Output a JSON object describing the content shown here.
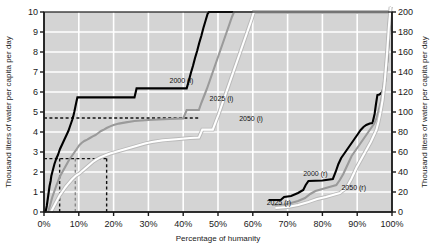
{
  "chart_data": {
    "type": "line",
    "title": "",
    "xlabel": "Percentage of humanity",
    "ylabel_left": "Thousand liters of water per capita per day",
    "ylabel_right": "Thousand liters of water per capita per day",
    "xlim": [
      0,
      100
    ],
    "ylim_left": [
      0,
      10
    ],
    "ylim_right": [
      0,
      200
    ],
    "grid": true,
    "legend_position": "inline-annotations",
    "xticks": [
      "0%",
      "10%",
      "20%",
      "30%",
      "40%",
      "50%",
      "60%",
      "70%",
      "80%",
      "90%",
      "100%"
    ],
    "xtick_values": [
      0,
      10,
      20,
      30,
      40,
      50,
      60,
      70,
      80,
      90,
      100
    ],
    "yticks_left": [
      "0",
      "1",
      "2",
      "3",
      "4",
      "5",
      "6",
      "7",
      "8",
      "9",
      "10"
    ],
    "ytick_values_left": [
      0,
      1,
      2,
      3,
      4,
      5,
      6,
      7,
      8,
      9,
      10
    ],
    "yticks_right": [
      "0",
      "20",
      "40",
      "60",
      "80",
      "100",
      "120",
      "140",
      "160",
      "180",
      "200"
    ],
    "ytick_values_right": [
      0,
      20,
      40,
      60,
      80,
      100,
      120,
      140,
      160,
      180,
      200
    ],
    "plot_bg_color": "#d4d4d4",
    "grid_color": "#ffffff",
    "series": [
      {
        "name": "2000 (l)",
        "axis": "left",
        "color": "#000000",
        "width": 2.1,
        "label_x": 39.5,
        "label_y": 6.45,
        "points": [
          [
            0.0,
            0.0
          ],
          [
            0.5,
            0.05
          ],
          [
            0.8,
            0.3
          ],
          [
            1.0,
            0.55
          ],
          [
            1.2,
            0.8
          ],
          [
            1.4,
            1.05
          ],
          [
            1.6,
            1.3
          ],
          [
            1.9,
            1.55
          ],
          [
            2.1,
            1.8
          ],
          [
            2.4,
            2.0
          ],
          [
            2.7,
            2.2
          ],
          [
            3.0,
            2.4
          ],
          [
            3.3,
            2.55
          ],
          [
            3.6,
            2.7
          ],
          [
            4.0,
            2.85
          ],
          [
            4.3,
            3.0
          ],
          [
            4.6,
            3.15
          ],
          [
            5.0,
            3.3
          ],
          [
            5.4,
            3.45
          ],
          [
            5.8,
            3.6
          ],
          [
            6.2,
            3.75
          ],
          [
            6.6,
            3.9
          ],
          [
            7.0,
            4.05
          ],
          [
            7.4,
            4.25
          ],
          [
            7.8,
            4.45
          ],
          [
            8.1,
            4.6
          ],
          [
            8.4,
            4.78
          ],
          [
            8.7,
            5.0
          ],
          [
            9.0,
            5.25
          ],
          [
            9.3,
            5.5
          ],
          [
            9.6,
            5.73
          ],
          [
            10.2,
            5.73
          ],
          [
            26.0,
            5.73
          ],
          [
            26.6,
            6.18
          ],
          [
            41.0,
            6.18
          ],
          [
            41.6,
            6.55
          ],
          [
            42.2,
            6.95
          ],
          [
            42.8,
            7.3
          ],
          [
            43.4,
            7.7
          ],
          [
            44.0,
            8.05
          ],
          [
            44.6,
            8.45
          ],
          [
            45.2,
            8.8
          ],
          [
            45.8,
            9.2
          ],
          [
            46.4,
            9.55
          ],
          [
            47.0,
            9.9
          ],
          [
            47.4,
            10.0
          ],
          [
            100.0,
            10.0
          ]
        ]
      },
      {
        "name": "2025 (l)",
        "axis": "left",
        "color": "#9a9a9a",
        "width": 2.1,
        "label_x": 51.0,
        "label_y": 5.55,
        "points": [
          [
            1.2,
            0.0
          ],
          [
            1.6,
            0.25
          ],
          [
            2.0,
            0.5
          ],
          [
            2.4,
            0.75
          ],
          [
            2.8,
            0.95
          ],
          [
            3.2,
            1.15
          ],
          [
            3.6,
            1.35
          ],
          [
            4.0,
            1.52
          ],
          [
            4.4,
            1.7
          ],
          [
            4.8,
            1.85
          ],
          [
            5.2,
            1.98
          ],
          [
            5.6,
            2.1
          ],
          [
            6.0,
            2.22
          ],
          [
            6.4,
            2.35
          ],
          [
            6.8,
            2.48
          ],
          [
            7.2,
            2.6
          ],
          [
            7.8,
            2.75
          ],
          [
            8.4,
            2.9
          ],
          [
            9.0,
            3.05
          ],
          [
            9.6,
            3.2
          ],
          [
            10.2,
            3.35
          ],
          [
            10.8,
            3.45
          ],
          [
            11.6,
            3.55
          ],
          [
            12.4,
            3.62
          ],
          [
            13.2,
            3.7
          ],
          [
            14.0,
            3.78
          ],
          [
            14.8,
            3.85
          ],
          [
            15.6,
            3.95
          ],
          [
            16.4,
            4.05
          ],
          [
            17.2,
            4.12
          ],
          [
            18.0,
            4.2
          ],
          [
            19.0,
            4.28
          ],
          [
            20.0,
            4.35
          ],
          [
            21.5,
            4.42
          ],
          [
            23.5,
            4.48
          ],
          [
            26.0,
            4.55
          ],
          [
            30.0,
            4.6
          ],
          [
            36.0,
            4.65
          ],
          [
            40.0,
            4.68
          ],
          [
            41.0,
            5.1
          ],
          [
            44.5,
            5.1
          ],
          [
            45.2,
            5.45
          ],
          [
            46.0,
            5.8
          ],
          [
            46.8,
            6.15
          ],
          [
            47.6,
            6.55
          ],
          [
            48.4,
            6.95
          ],
          [
            49.2,
            7.35
          ],
          [
            50.0,
            7.75
          ],
          [
            50.8,
            8.15
          ],
          [
            51.6,
            8.55
          ],
          [
            52.4,
            8.95
          ],
          [
            53.2,
            9.35
          ],
          [
            54.0,
            9.75
          ],
          [
            54.6,
            10.0
          ],
          [
            100.0,
            10.0
          ]
        ]
      },
      {
        "name": "2050 (l)",
        "axis": "left",
        "color": "#ffffff",
        "width": 2.1,
        "label_x": 59.5,
        "label_y": 4.55,
        "points": [
          [
            2.0,
            0.0
          ],
          [
            2.6,
            0.2
          ],
          [
            3.2,
            0.4
          ],
          [
            3.8,
            0.6
          ],
          [
            4.4,
            0.8
          ],
          [
            5.0,
            0.95
          ],
          [
            5.6,
            1.1
          ],
          [
            6.2,
            1.25
          ],
          [
            6.8,
            1.38
          ],
          [
            7.4,
            1.5
          ],
          [
            8.0,
            1.62
          ],
          [
            8.6,
            1.72
          ],
          [
            9.2,
            1.82
          ],
          [
            10.0,
            1.9
          ],
          [
            11.0,
            2.05
          ],
          [
            12.0,
            2.2
          ],
          [
            13.0,
            2.35
          ],
          [
            14.0,
            2.5
          ],
          [
            15.0,
            2.62
          ],
          [
            16.0,
            2.72
          ],
          [
            17.5,
            2.82
          ],
          [
            19.0,
            2.92
          ],
          [
            21.0,
            3.02
          ],
          [
            23.0,
            3.12
          ],
          [
            25.0,
            3.22
          ],
          [
            27.0,
            3.32
          ],
          [
            29.0,
            3.42
          ],
          [
            31.0,
            3.5
          ],
          [
            34.0,
            3.58
          ],
          [
            38.0,
            3.64
          ],
          [
            42.0,
            3.7
          ],
          [
            44.5,
            3.72
          ],
          [
            45.5,
            4.12
          ],
          [
            48.5,
            4.12
          ],
          [
            49.3,
            4.48
          ],
          [
            50.1,
            4.85
          ],
          [
            50.9,
            5.25
          ],
          [
            51.7,
            5.65
          ],
          [
            52.5,
            6.05
          ],
          [
            53.3,
            6.45
          ],
          [
            54.1,
            6.85
          ],
          [
            54.9,
            7.25
          ],
          [
            55.7,
            7.65
          ],
          [
            56.5,
            8.05
          ],
          [
            57.3,
            8.45
          ],
          [
            58.1,
            8.85
          ],
          [
            58.9,
            9.25
          ],
          [
            59.7,
            9.65
          ],
          [
            60.3,
            10.0
          ],
          [
            100.0,
            10.0
          ]
        ]
      },
      {
        "name": "2000 (r)",
        "axis": "right",
        "color": "#000000",
        "width": 2.1,
        "label_x": 78.0,
        "label_y": 36.0,
        "points": [
          [
            64.5,
            12.0
          ],
          [
            68.0,
            12.0
          ],
          [
            69.0,
            15.0
          ],
          [
            71.0,
            16.0
          ],
          [
            73.0,
            19.0
          ],
          [
            74.5,
            22.0
          ],
          [
            75.2,
            27.0
          ],
          [
            76.0,
            31.0
          ],
          [
            80.0,
            31.5
          ],
          [
            83.0,
            33.0
          ],
          [
            83.8,
            40.0
          ],
          [
            84.6,
            48.0
          ],
          [
            85.4,
            54.0
          ],
          [
            86.2,
            58.0
          ],
          [
            87.0,
            62.0
          ],
          [
            87.8,
            66.0
          ],
          [
            88.6,
            70.0
          ],
          [
            89.4,
            74.0
          ],
          [
            90.2,
            78.0
          ],
          [
            91.0,
            82.0
          ],
          [
            91.8,
            85.0
          ],
          [
            92.6,
            87.0
          ],
          [
            93.6,
            88.5
          ],
          [
            94.4,
            89.0
          ],
          [
            95.0,
            98.0
          ],
          [
            95.4,
            108.0
          ],
          [
            95.8,
            117.0
          ],
          [
            96.4,
            117.5
          ],
          [
            97.2,
            120.0
          ],
          [
            98.0,
            130.0
          ],
          [
            98.6,
            150.0
          ],
          [
            99.1,
            175.0
          ],
          [
            99.5,
            200.0
          ],
          [
            99.8,
            205.0
          ]
        ]
      },
      {
        "name": "2025 (r)",
        "axis": "right",
        "color": "#9a9a9a",
        "width": 2.1,
        "label_x": 67.5,
        "label_y": 7.0,
        "points": [
          [
            65.5,
            7.0
          ],
          [
            69.0,
            7.5
          ],
          [
            71.0,
            9.0
          ],
          [
            73.0,
            11.0
          ],
          [
            75.0,
            14.0
          ],
          [
            76.5,
            18.0
          ],
          [
            78.0,
            21.0
          ],
          [
            80.0,
            23.0
          ],
          [
            82.0,
            25.0
          ],
          [
            84.0,
            27.0
          ],
          [
            85.0,
            32.0
          ],
          [
            86.0,
            38.0
          ],
          [
            86.8,
            44.0
          ],
          [
            87.6,
            50.0
          ],
          [
            88.4,
            56.0
          ],
          [
            89.2,
            60.0
          ],
          [
            90.0,
            64.0
          ],
          [
            90.8,
            68.0
          ],
          [
            91.6,
            72.0
          ],
          [
            92.4,
            76.0
          ],
          [
            93.2,
            80.0
          ],
          [
            94.0,
            84.0
          ],
          [
            94.8,
            88.0
          ],
          [
            95.6,
            94.0
          ],
          [
            96.2,
            102.0
          ],
          [
            96.8,
            110.0
          ],
          [
            97.4,
            122.0
          ],
          [
            98.0,
            140.0
          ],
          [
            98.6,
            165.0
          ],
          [
            99.2,
            195.0
          ],
          [
            99.6,
            205.0
          ]
        ]
      },
      {
        "name": "2050 (r)",
        "axis": "right",
        "color": "#ffffff",
        "width": 2.1,
        "label_x": 89.0,
        "label_y": 22.0,
        "points": [
          [
            66.5,
            4.0
          ],
          [
            70.0,
            5.0
          ],
          [
            73.0,
            7.0
          ],
          [
            76.0,
            10.0
          ],
          [
            78.5,
            13.0
          ],
          [
            81.0,
            15.0
          ],
          [
            83.0,
            17.0
          ],
          [
            85.0,
            19.0
          ],
          [
            86.5,
            23.0
          ],
          [
            87.5,
            28.0
          ],
          [
            88.3,
            33.0
          ],
          [
            89.1,
            39.0
          ],
          [
            89.9,
            45.0
          ],
          [
            90.7,
            50.0
          ],
          [
            91.5,
            55.0
          ],
          [
            92.3,
            60.0
          ],
          [
            93.1,
            65.0
          ],
          [
            93.9,
            70.0
          ],
          [
            94.7,
            76.0
          ],
          [
            95.5,
            82.0
          ],
          [
            96.1,
            90.0
          ],
          [
            96.7,
            100.0
          ],
          [
            97.3,
            112.0
          ],
          [
            97.9,
            130.0
          ],
          [
            98.5,
            155.0
          ],
          [
            99.1,
            185.0
          ],
          [
            99.6,
            205.0
          ]
        ]
      }
    ],
    "reference_lines": [
      {
        "name": "ref-h-2000",
        "orientation": "horizontal",
        "axis": "left",
        "value": 4.7,
        "x_from": 0,
        "x_to": 44.5,
        "color": "#111111"
      },
      {
        "name": "ref-h-2025",
        "orientation": "horizontal",
        "axis": "left",
        "value": 2.67,
        "x_from": 0,
        "x_to": 18.0,
        "color": "#111111"
      },
      {
        "name": "ref-v-a",
        "orientation": "vertical",
        "x": 4.5,
        "y_from": 0,
        "y_to": 2.67,
        "color": "#111111"
      },
      {
        "name": "ref-v-b",
        "orientation": "vertical",
        "x": 9.0,
        "y_from": 0,
        "y_to": 2.67,
        "color": "#888888"
      },
      {
        "name": "ref-v-c",
        "orientation": "vertical",
        "x": 18.0,
        "y_from": 0,
        "y_to": 2.67,
        "color": "#111111"
      }
    ]
  }
}
